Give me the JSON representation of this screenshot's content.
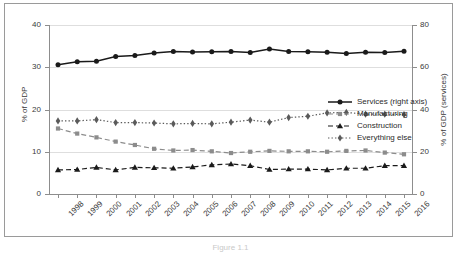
{
  "chart_data": {
    "type": "line",
    "title": "",
    "xlabel": "",
    "ylabel": "% of GDP",
    "ylabel_right": "% of GDP (services)",
    "grid": true,
    "legend_position": "inside-right",
    "x": [
      "1998",
      "1999",
      "2000",
      "2001",
      "2002",
      "2003",
      "2004",
      "2005",
      "2006",
      "2007",
      "2008",
      "2009",
      "2010",
      "2011",
      "2012",
      "2013",
      "2014",
      "2015",
      "2016"
    ],
    "ylim": [
      0,
      40
    ],
    "yticks": [
      0,
      10,
      20,
      30,
      40
    ],
    "ylim_right": [
      0,
      80
    ],
    "yticks_right": [
      0,
      20,
      40,
      60,
      80
    ],
    "series": [
      {
        "name": "Services (right axis)",
        "axis": "right",
        "marker": "circle",
        "line_style": "solid",
        "color": "#1a1a1a",
        "values": [
          61.2,
          62.6,
          62.8,
          65.1,
          65.6,
          66.7,
          67.5,
          67.2,
          67.3,
          67.4,
          67.0,
          68.6,
          67.5,
          67.3,
          67.1,
          66.5,
          67.1,
          67.0,
          67.6
        ]
      },
      {
        "name": "Manufacturing",
        "axis": "left",
        "marker": "square",
        "line_style": "dashed",
        "color": "#8c8c8c",
        "values": [
          15.5,
          14.3,
          13.4,
          12.4,
          11.6,
          10.7,
          10.3,
          10.4,
          10.1,
          9.7,
          10.0,
          10.2,
          10.1,
          10.1,
          10.0,
          10.2,
          10.3,
          9.8,
          9.4
        ]
      },
      {
        "name": "Construction",
        "axis": "left",
        "marker": "triangle",
        "line_style": "dashed",
        "color": "#1a1a1a",
        "values": [
          5.7,
          5.8,
          6.3,
          5.7,
          6.3,
          6.2,
          6.1,
          6.4,
          6.9,
          7.1,
          6.7,
          5.8,
          5.9,
          5.9,
          5.7,
          6.1,
          6.1,
          6.7,
          6.7
        ]
      },
      {
        "name": "Everything else",
        "axis": "left",
        "marker": "diamond",
        "line_style": "dotted",
        "color": "#5a5a5a",
        "values": [
          17.3,
          17.3,
          17.6,
          16.9,
          16.9,
          16.8,
          16.6,
          16.7,
          16.6,
          17.0,
          17.5,
          17.0,
          18.1,
          18.4,
          19.2,
          19.3,
          18.9,
          18.9,
          18.8
        ]
      }
    ]
  },
  "caption": "Figure 1.1"
}
